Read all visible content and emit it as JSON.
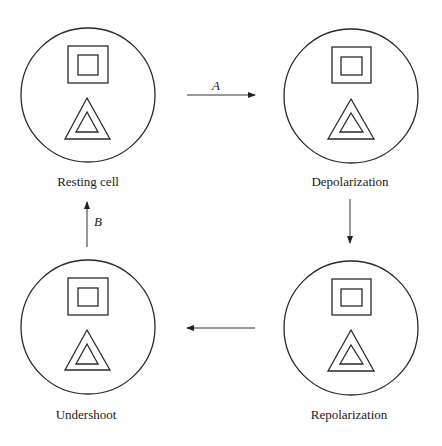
{
  "diagram": {
    "cells": [
      {
        "id": "resting",
        "label": "Resting cell"
      },
      {
        "id": "depolarization",
        "label": "Depolarization"
      },
      {
        "id": "undershoot",
        "label": "Undershoot"
      },
      {
        "id": "repolarization",
        "label": "Repolarization"
      }
    ],
    "arrows": [
      {
        "from": "resting",
        "to": "depolarization",
        "label": "A",
        "direction": "right"
      },
      {
        "from": "depolarization",
        "to": "repolarization",
        "label": "",
        "direction": "down"
      },
      {
        "from": "repolarization",
        "to": "undershoot",
        "label": "",
        "direction": "left"
      },
      {
        "from": "undershoot",
        "to": "resting",
        "label": "B",
        "direction": "up"
      }
    ],
    "cell_contents": [
      "nested-square",
      "nested-triangle"
    ]
  }
}
